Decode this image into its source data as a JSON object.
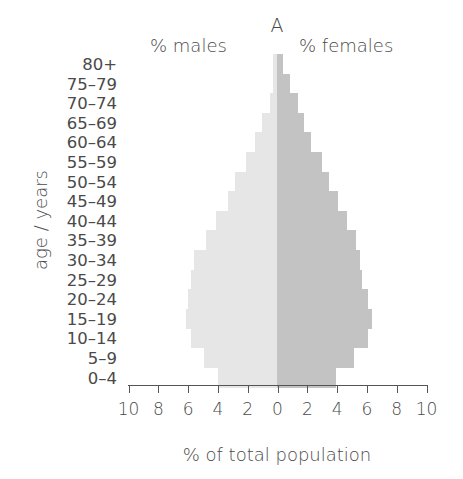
{
  "chart_data": {
    "type": "bar",
    "subtype": "population-pyramid",
    "title": "A",
    "xlabel": "% of total population",
    "ylabel": "age / years",
    "left_label": "% males",
    "right_label": "% females",
    "xlim": [
      -10,
      10
    ],
    "xticks": [
      10,
      8,
      6,
      4,
      2,
      0,
      2,
      4,
      6,
      8,
      10
    ],
    "grid": false,
    "categories": [
      "80+",
      "75–79",
      "70–74",
      "65–69",
      "60–64",
      "55–59",
      "50–54",
      "45–49",
      "40–44",
      "35–39",
      "30–34",
      "25–29",
      "20–24",
      "15–19",
      "10–14",
      "5–9",
      "0–4"
    ],
    "series": [
      {
        "name": "males",
        "color": "#e6e6e6",
        "values": [
          0.3,
          0.3,
          0.5,
          1.0,
          1.5,
          2.1,
          2.8,
          3.3,
          4.1,
          4.8,
          5.6,
          5.8,
          6.0,
          6.1,
          5.8,
          4.9,
          4.0
        ]
      },
      {
        "name": "females",
        "color": "#c3c3c3",
        "values": [
          0.4,
          0.9,
          1.4,
          1.8,
          2.3,
          3.0,
          3.5,
          4.1,
          4.7,
          5.3,
          5.6,
          5.7,
          6.1,
          6.4,
          6.1,
          5.2,
          4.0
        ]
      }
    ]
  }
}
